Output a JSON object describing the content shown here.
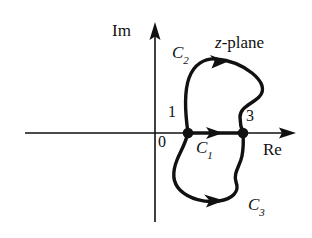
{
  "figure": {
    "title_label": "z-plane",
    "title_italic_part": "z",
    "title_roman_part": "-plane",
    "axes": {
      "imaginary_label": "Im",
      "real_label": "Re",
      "origin_label": "0",
      "axis_color": "#111111"
    },
    "points": [
      {
        "name": "branch-point-1",
        "label": "1",
        "x": 1
      },
      {
        "name": "branch-point-3",
        "label": "3",
        "x": 3
      }
    ],
    "contours": [
      {
        "name": "C1",
        "label": "C",
        "subscript": "1",
        "description": "straight segment on real axis from 1 to 3",
        "direction": "rightward"
      },
      {
        "name": "C2",
        "label": "C",
        "subscript": "2",
        "description": "upper loop from 1 over the top to 3",
        "direction": "clockwise-over-top"
      },
      {
        "name": "C3",
        "label": "C",
        "subscript": "3",
        "description": "lower loop from 1 under the bottom to 3",
        "direction": "clockwise-under-bottom"
      }
    ],
    "colors": {
      "ink": "#111111",
      "background": "#ffffff"
    }
  }
}
